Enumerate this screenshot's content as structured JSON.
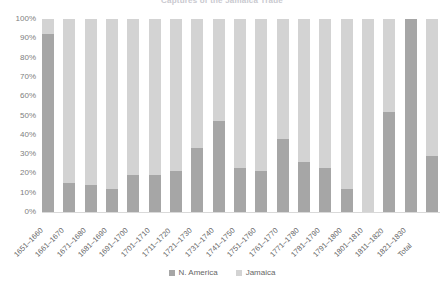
{
  "chart_data": {
    "type": "bar",
    "subtype": "stacked-100-percent",
    "title": "Captures of the Jamaica Trade",
    "categories": [
      "1651–1660",
      "1661–1670",
      "1671–1680",
      "1681–1690",
      "1691–1700",
      "1701–1710",
      "1711–1720",
      "1721–1730",
      "1731–1740",
      "1741–1750",
      "1751–1760",
      "1761–1770",
      "1771–1780",
      "1781–1790",
      "1791–1800",
      "1801–1810",
      "1811–1820",
      "1821–1830",
      "Total"
    ],
    "series": [
      {
        "name": "N. America",
        "color": "#a6a6a6",
        "values": [
          92,
          15,
          14,
          12,
          19,
          19,
          21,
          33,
          47,
          23,
          21,
          38,
          26,
          23,
          12,
          0,
          52,
          100,
          29
        ]
      },
      {
        "name": "Jamaica",
        "color": "#d3d3d3",
        "values": [
          8,
          85,
          86,
          88,
          81,
          81,
          79,
          67,
          53,
          77,
          79,
          62,
          74,
          77,
          88,
          100,
          48,
          0,
          71
        ]
      }
    ],
    "xlabel": "",
    "ylabel": "",
    "ylim": [
      0,
      100
    ],
    "yticks": [
      "0%",
      "10%",
      "20%",
      "30%",
      "40%",
      "50%",
      "60%",
      "70%",
      "80%",
      "90%",
      "100%"
    ],
    "grid": false,
    "legend_position": "bottom"
  }
}
